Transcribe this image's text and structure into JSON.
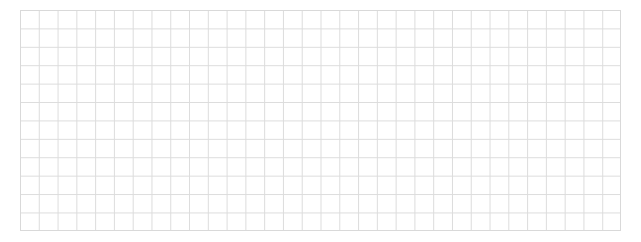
{
  "grid": {
    "columns": 32,
    "rows": 12,
    "line_color": "#dcdcdc",
    "background_color": "#ffffff"
  }
}
